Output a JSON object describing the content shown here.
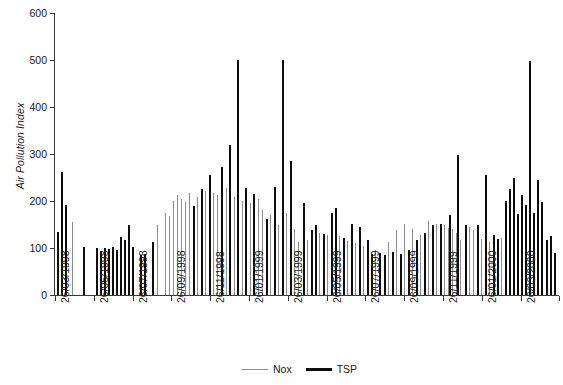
{
  "chart_data": {
    "type": "bar",
    "title": "",
    "subtitle": "",
    "xlabel": "",
    "ylabel": "Air Pollution Index",
    "ylim": [
      0,
      600
    ],
    "y_ticks": [
      0,
      100,
      200,
      300,
      400,
      500,
      600
    ],
    "grid": false,
    "legend_position": "bottom-center",
    "x_tick_labels": [
      "26/03/1998",
      "26/05/1998",
      "26/07/1998",
      "26/09/1998",
      "26/11/1998",
      "26/01/1999",
      "26/03/1999",
      "26/05/1999",
      "26/07/1999",
      "26/09/1999",
      "26/11/1999",
      "26/01/2000",
      "26/03/2000",
      "26/05/2000"
    ],
    "x_tick_positions": [
      0,
      38.8,
      77.6,
      116.4,
      155.2,
      194.0,
      232.8,
      271.6,
      310.4,
      349.2,
      388.0,
      426.8,
      465.6,
      504.0
    ],
    "series": [
      {
        "name": "Nox",
        "color": "#8d8d8d",
        "points": [
          {
            "x": 18.5,
            "y": 155
          },
          {
            "x": 113.0,
            "y": 150
          },
          {
            "x": 122.0,
            "y": 175
          },
          {
            "x": 126.5,
            "y": 168
          },
          {
            "x": 131.0,
            "y": 200
          },
          {
            "x": 135.5,
            "y": 212
          },
          {
            "x": 140.0,
            "y": 205
          },
          {
            "x": 144.5,
            "y": 198
          },
          {
            "x": 149.0,
            "y": 218
          },
          {
            "x": 158.0,
            "y": 208
          },
          {
            "x": 167.0,
            "y": 222
          },
          {
            "x": 176.0,
            "y": 216
          },
          {
            "x": 180.5,
            "y": 212
          },
          {
            "x": 185.0,
            "y": 190
          },
          {
            "x": 189.5,
            "y": 228
          },
          {
            "x": 194.0,
            "y": 210
          },
          {
            "x": 198.5,
            "y": 208
          },
          {
            "x": 203.0,
            "y": 212
          },
          {
            "x": 207.5,
            "y": 200
          },
          {
            "x": 212.0,
            "y": 205
          },
          {
            "x": 216.5,
            "y": 195
          },
          {
            "x": 221.0,
            "y": 188
          },
          {
            "x": 225.5,
            "y": 205
          },
          {
            "x": 230.0,
            "y": 180
          },
          {
            "x": 239.0,
            "y": 170
          },
          {
            "x": 243.5,
            "y": 210
          },
          {
            "x": 248.0,
            "y": 150
          },
          {
            "x": 257.0,
            "y": 175
          },
          {
            "x": 266.0,
            "y": 140
          },
          {
            "x": 270.5,
            "y": 112
          },
          {
            "x": 279.5,
            "y": 118
          },
          {
            "x": 293.0,
            "y": 132
          },
          {
            "x": 302.0,
            "y": 128
          },
          {
            "x": 315.5,
            "y": 125
          },
          {
            "x": 324.5,
            "y": 115
          },
          {
            "x": 333.5,
            "y": 110
          },
          {
            "x": 342.5,
            "y": 105
          },
          {
            "x": 356.0,
            "y": 95
          },
          {
            "x": 369.5,
            "y": 112
          },
          {
            "x": 378.5,
            "y": 138
          },
          {
            "x": 387.5,
            "y": 152
          },
          {
            "x": 396.5,
            "y": 140
          },
          {
            "x": 405.5,
            "y": 128
          },
          {
            "x": 414.5,
            "y": 158
          },
          {
            "x": 423.5,
            "y": 152
          },
          {
            "x": 432.5,
            "y": 148
          },
          {
            "x": 437.0,
            "y": 142
          },
          {
            "x": 441.5,
            "y": 140
          },
          {
            "x": 446.0,
            "y": 132
          },
          {
            "x": 450.5,
            "y": 118
          },
          {
            "x": 455.0,
            "y": 128
          },
          {
            "x": 459.5,
            "y": 145
          },
          {
            "x": 464.0,
            "y": 138
          },
          {
            "x": 473.0,
            "y": 120
          },
          {
            "x": 482.0,
            "y": 112
          },
          {
            "x": 495.5,
            "y": 122
          }
        ]
      },
      {
        "name": "TSP",
        "color": "#0d0d0d",
        "points": [
          {
            "x": 2.0,
            "y": 135
          },
          {
            "x": 6.5,
            "y": 262
          },
          {
            "x": 11.0,
            "y": 192
          },
          {
            "x": 31.5,
            "y": 103
          },
          {
            "x": 45.0,
            "y": 100
          },
          {
            "x": 49.5,
            "y": 93
          },
          {
            "x": 54.0,
            "y": 100
          },
          {
            "x": 58.5,
            "y": 98
          },
          {
            "x": 63.0,
            "y": 103
          },
          {
            "x": 67.5,
            "y": 96
          },
          {
            "x": 72.0,
            "y": 124
          },
          {
            "x": 76.5,
            "y": 118
          },
          {
            "x": 81.0,
            "y": 150
          },
          {
            "x": 85.5,
            "y": 102
          },
          {
            "x": 94.5,
            "y": 85
          },
          {
            "x": 99.0,
            "y": 88
          },
          {
            "x": 108.0,
            "y": 112
          },
          {
            "x": 153.5,
            "y": 190
          },
          {
            "x": 162.5,
            "y": 225
          },
          {
            "x": 171.5,
            "y": 255
          },
          {
            "x": 184.0,
            "y": 272
          },
          {
            "x": 193.0,
            "y": 320
          },
          {
            "x": 202.0,
            "y": 500
          },
          {
            "x": 211.0,
            "y": 228
          },
          {
            "x": 220.0,
            "y": 215
          },
          {
            "x": 234.5,
            "y": 162
          },
          {
            "x": 243.0,
            "y": 230
          },
          {
            "x": 252.0,
            "y": 500
          },
          {
            "x": 261.0,
            "y": 285
          },
          {
            "x": 275.0,
            "y": 195
          },
          {
            "x": 284.0,
            "y": 138
          },
          {
            "x": 288.5,
            "y": 148
          },
          {
            "x": 297.5,
            "y": 130
          },
          {
            "x": 306.5,
            "y": 175
          },
          {
            "x": 311.0,
            "y": 185
          },
          {
            "x": 320.0,
            "y": 122
          },
          {
            "x": 329.0,
            "y": 152
          },
          {
            "x": 338.0,
            "y": 145
          },
          {
            "x": 347.0,
            "y": 118
          },
          {
            "x": 351.5,
            "y": 88
          },
          {
            "x": 360.5,
            "y": 90
          },
          {
            "x": 365.0,
            "y": 85
          },
          {
            "x": 374.0,
            "y": 92
          },
          {
            "x": 383.0,
            "y": 88
          },
          {
            "x": 392.0,
            "y": 95
          },
          {
            "x": 401.0,
            "y": 118
          },
          {
            "x": 410.0,
            "y": 132
          },
          {
            "x": 419.0,
            "y": 150
          },
          {
            "x": 428.0,
            "y": 152
          },
          {
            "x": 437.5,
            "y": 170
          },
          {
            "x": 446.5,
            "y": 298
          },
          {
            "x": 455.5,
            "y": 148
          },
          {
            "x": 469.0,
            "y": 150
          },
          {
            "x": 478.0,
            "y": 255
          },
          {
            "x": 487.0,
            "y": 128
          },
          {
            "x": 491.5,
            "y": 120
          },
          {
            "x": 500.0,
            "y": 200
          },
          {
            "x": 504.5,
            "y": 225
          },
          {
            "x": 509.0,
            "y": 248
          },
          {
            "x": 513.5,
            "y": 172
          },
          {
            "x": 518.0,
            "y": 212
          },
          {
            "x": 522.5,
            "y": 192
          },
          {
            "x": 527.0,
            "y": 498
          },
          {
            "x": 531.5,
            "y": 175
          },
          {
            "x": 536.0,
            "y": 245
          },
          {
            "x": 540.5,
            "y": 198
          },
          {
            "x": 545.0,
            "y": 118
          },
          {
            "x": 549.5,
            "y": 125
          },
          {
            "x": 554.0,
            "y": 90
          }
        ]
      }
    ]
  },
  "legend": {
    "items": [
      {
        "label": "Nox",
        "style": "thin-gray-line"
      },
      {
        "label": "TSP",
        "style": "thick-black-line"
      }
    ]
  },
  "colors": {
    "nox": "#8d8d8d",
    "tsp": "#0d0d0d",
    "axis": "#3a3a3a",
    "text": "#1a1a1a",
    "background": "#ffffff"
  }
}
